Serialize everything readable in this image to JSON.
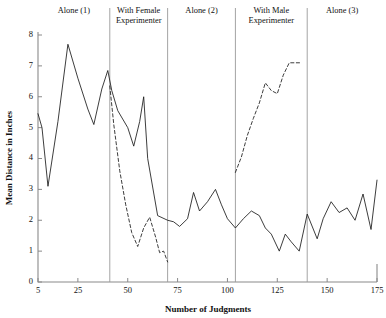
{
  "chart_data": {
    "type": "line",
    "title": "",
    "xlabel": "Number of Judgments",
    "ylabel": "Mean Distance in Inches",
    "xlim": [
      5,
      175
    ],
    "ylim": [
      0,
      8
    ],
    "xticks": [
      5,
      25,
      50,
      75,
      100,
      125,
      150,
      175
    ],
    "yticks": [
      0,
      1,
      2,
      3,
      4,
      5,
      6,
      7,
      8
    ],
    "grid": false,
    "legend": "none",
    "panels": [
      {
        "label": "Alone (1)",
        "x_start": 5,
        "x_end": 41
      },
      {
        "label": "With Female Experimenter",
        "x_start": 41,
        "x_end": 70
      },
      {
        "label": "Alone (2)",
        "x_start": 70,
        "x_end": 104
      },
      {
        "label": "With Male Experimenter",
        "x_start": 104,
        "x_end": 140
      },
      {
        "label": "Alone (3)",
        "x_start": 140,
        "x_end": 175
      }
    ],
    "dividers": [
      41,
      70,
      104,
      140
    ],
    "series": [
      {
        "name": "Alone (subject line, solid)",
        "style": "solid",
        "x": [
          5,
          7,
          10,
          15,
          20,
          25,
          30,
          33,
          37,
          40,
          42,
          45,
          50,
          53,
          56,
          58,
          60,
          65,
          70,
          73,
          76,
          80,
          83,
          86,
          90,
          94,
          97,
          100,
          104,
          108,
          112,
          116,
          119,
          122,
          126,
          129,
          132,
          136,
          140,
          145,
          148,
          152,
          156,
          160,
          164,
          168,
          172,
          175
        ],
        "y": [
          5.45,
          5.0,
          3.1,
          5.2,
          7.7,
          6.6,
          5.6,
          5.1,
          6.25,
          6.85,
          6.2,
          5.55,
          5.0,
          4.4,
          5.2,
          6.0,
          4.0,
          2.15,
          2.0,
          1.95,
          1.8,
          2.05,
          2.9,
          2.3,
          2.6,
          3.0,
          2.5,
          2.05,
          1.75,
          2.05,
          2.3,
          2.15,
          1.75,
          1.55,
          1.0,
          1.55,
          1.3,
          1.0,
          2.2,
          1.4,
          2.05,
          2.6,
          2.25,
          2.4,
          2.0,
          2.85,
          1.7,
          3.3
        ]
      },
      {
        "name": "With Female Experimenter (dashed)",
        "style": "dashed",
        "x": [
          41,
          43,
          46,
          49,
          52,
          55,
          58,
          61,
          64,
          66,
          68,
          70
        ],
        "y": [
          6.35,
          5.1,
          3.6,
          2.5,
          1.6,
          1.15,
          1.75,
          2.1,
          1.45,
          0.95,
          1.0,
          0.65
        ]
      },
      {
        "name": "With Male Experimenter (dashed)",
        "style": "dashed",
        "x": [
          104,
          107,
          110,
          113,
          116,
          119,
          122,
          125,
          128,
          131,
          134,
          137
        ],
        "y": [
          3.55,
          4.05,
          4.75,
          5.3,
          5.8,
          6.45,
          6.2,
          6.1,
          6.7,
          7.1,
          7.1,
          7.1
        ]
      }
    ]
  },
  "colors": {
    "line": "#1a1a1a",
    "axis": "#8a8a8a",
    "divider": "#9a9a9a",
    "background": "#ffffff"
  }
}
